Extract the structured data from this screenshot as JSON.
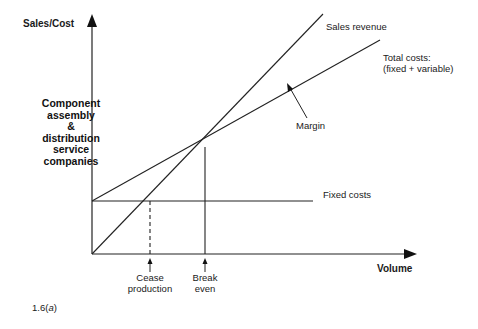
{
  "figure": {
    "caption": "1.6(a)",
    "y_axis_label": "Sales/Cost",
    "x_axis_label": "Volume",
    "side_label_lines": [
      "Component",
      "assembly",
      "&",
      "distribution",
      "service",
      "companies"
    ]
  },
  "lines": {
    "sales_revenue": "Sales revenue",
    "total_costs_line1": "Total costs:",
    "total_costs_line2": "(fixed + variable)",
    "fixed_costs": "Fixed costs",
    "margin": "Margin"
  },
  "markers": {
    "cease_line1": "Cease",
    "cease_line2": "production",
    "break_line1": "Break",
    "break_line2": "even"
  },
  "colors": {
    "ink": "#1a1a1a",
    "background": "#ffffff"
  }
}
